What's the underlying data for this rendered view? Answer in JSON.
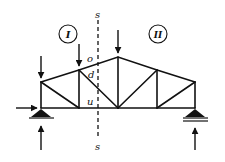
{
  "diagram": {
    "type": "truss-section-method",
    "section_line": {
      "label_top": "s",
      "label_bottom": "s"
    },
    "regions": [
      {
        "id": "I",
        "label": "I"
      },
      {
        "id": "II",
        "label": "II"
      }
    ],
    "members_cut": [
      {
        "id": "o",
        "label": "o",
        "kind": "top chord"
      },
      {
        "id": "d",
        "label": "d",
        "kind": "diagonal"
      },
      {
        "id": "u",
        "label": "u",
        "kind": "bottom chord"
      }
    ],
    "loads": [
      {
        "node": "left-top",
        "direction": "down"
      },
      {
        "node": "panel-2-top",
        "direction": "down"
      },
      {
        "node": "apex",
        "direction": "down"
      }
    ],
    "supports": [
      {
        "position": "left",
        "type": "pinned",
        "reactions": [
          "horizontal",
          "vertical"
        ]
      },
      {
        "position": "right",
        "type": "roller",
        "reactions": [
          "vertical"
        ]
      }
    ],
    "colors": {
      "line": "#111111",
      "background": "#ffffff"
    }
  }
}
